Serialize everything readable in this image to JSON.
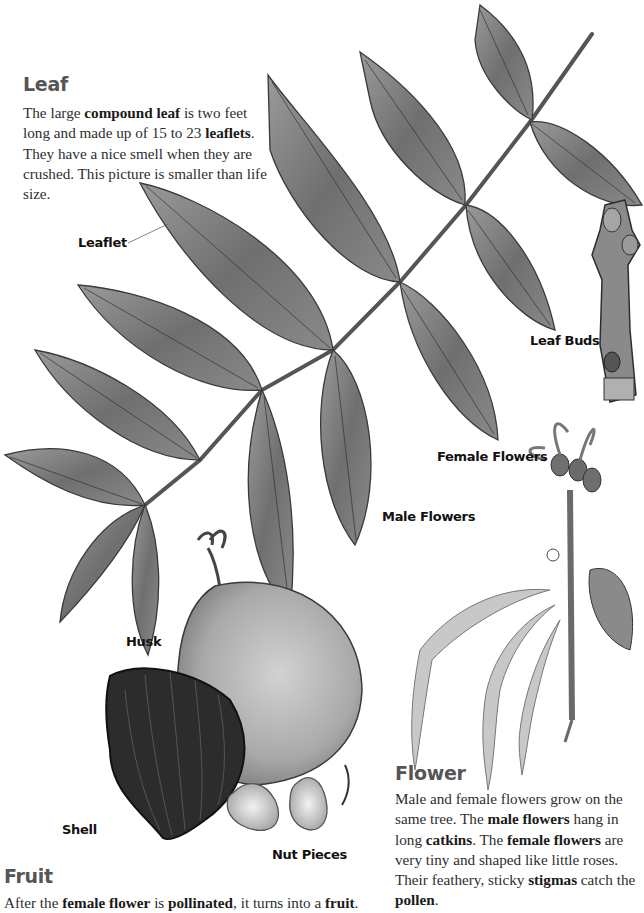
{
  "leaf_section": {
    "heading": "Leaf",
    "paragraph_parts": [
      {
        "text": "The large ",
        "bold": false
      },
      {
        "text": "compound leaf",
        "bold": true
      },
      {
        "text": " is two feet long and made up of 15 to 23 ",
        "bold": false
      },
      {
        "text": "leaflets",
        "bold": true
      },
      {
        "text": ". They have a nice smell when they are crushed. This picture is smaller than life size.",
        "bold": false
      }
    ]
  },
  "fruit_section": {
    "heading": "Fruit",
    "paragraph_parts": [
      {
        "text": "After the ",
        "bold": false
      },
      {
        "text": "female flower",
        "bold": true
      },
      {
        "text": " is ",
        "bold": false
      },
      {
        "text": "pollinated",
        "bold": true
      },
      {
        "text": ", it turns into a ",
        "bold": false
      },
      {
        "text": "fruit",
        "bold": true
      },
      {
        "text": ".",
        "bold": false
      }
    ]
  },
  "flower_section": {
    "heading": "Flower",
    "paragraph_parts": [
      {
        "text": "Male and female flowers grow on the same tree. The ",
        "bold": false
      },
      {
        "text": "male flowers",
        "bold": true
      },
      {
        "text": " hang in long ",
        "bold": false
      },
      {
        "text": "catkins",
        "bold": true
      },
      {
        "text": ". The ",
        "bold": false
      },
      {
        "text": "female flowers",
        "bold": true
      },
      {
        "text": " are very tiny and shaped like little roses. Their feathery, sticky ",
        "bold": false
      },
      {
        "text": "stigmas",
        "bold": true
      },
      {
        "text": " catch the ",
        "bold": false
      },
      {
        "text": "pollen",
        "bold": true
      },
      {
        "text": ".",
        "bold": false
      }
    ]
  },
  "labels": {
    "leaflet": "Leaflet",
    "leaf_buds": "Leaf Buds",
    "female_flowers": "Female Flowers",
    "male_flowers": "Male Flowers",
    "husk": "Husk",
    "shell": "Shell",
    "nut_pieces": "Nut Pieces"
  },
  "colors": {
    "heading": "#555555",
    "body_text": "#2e2e2e",
    "leaf_fill": "#7a7a7a",
    "leaf_stroke": "#3c3c3c",
    "husk_fill": "#b4b4b4",
    "shell_fill": "#2a2a2a"
  }
}
